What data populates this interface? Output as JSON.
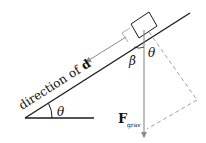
{
  "diagram": {
    "labels": {
      "direction": "direction of",
      "direction_bold": "d",
      "theta_base": "θ",
      "theta_force": "θ",
      "beta": "β",
      "force_main": "F",
      "force_sub": "grav"
    },
    "colors": {
      "line": "#1a1a1a",
      "arrow": "#8a8a8a",
      "dashed": "#a0a0a0",
      "text": "#111111"
    }
  }
}
